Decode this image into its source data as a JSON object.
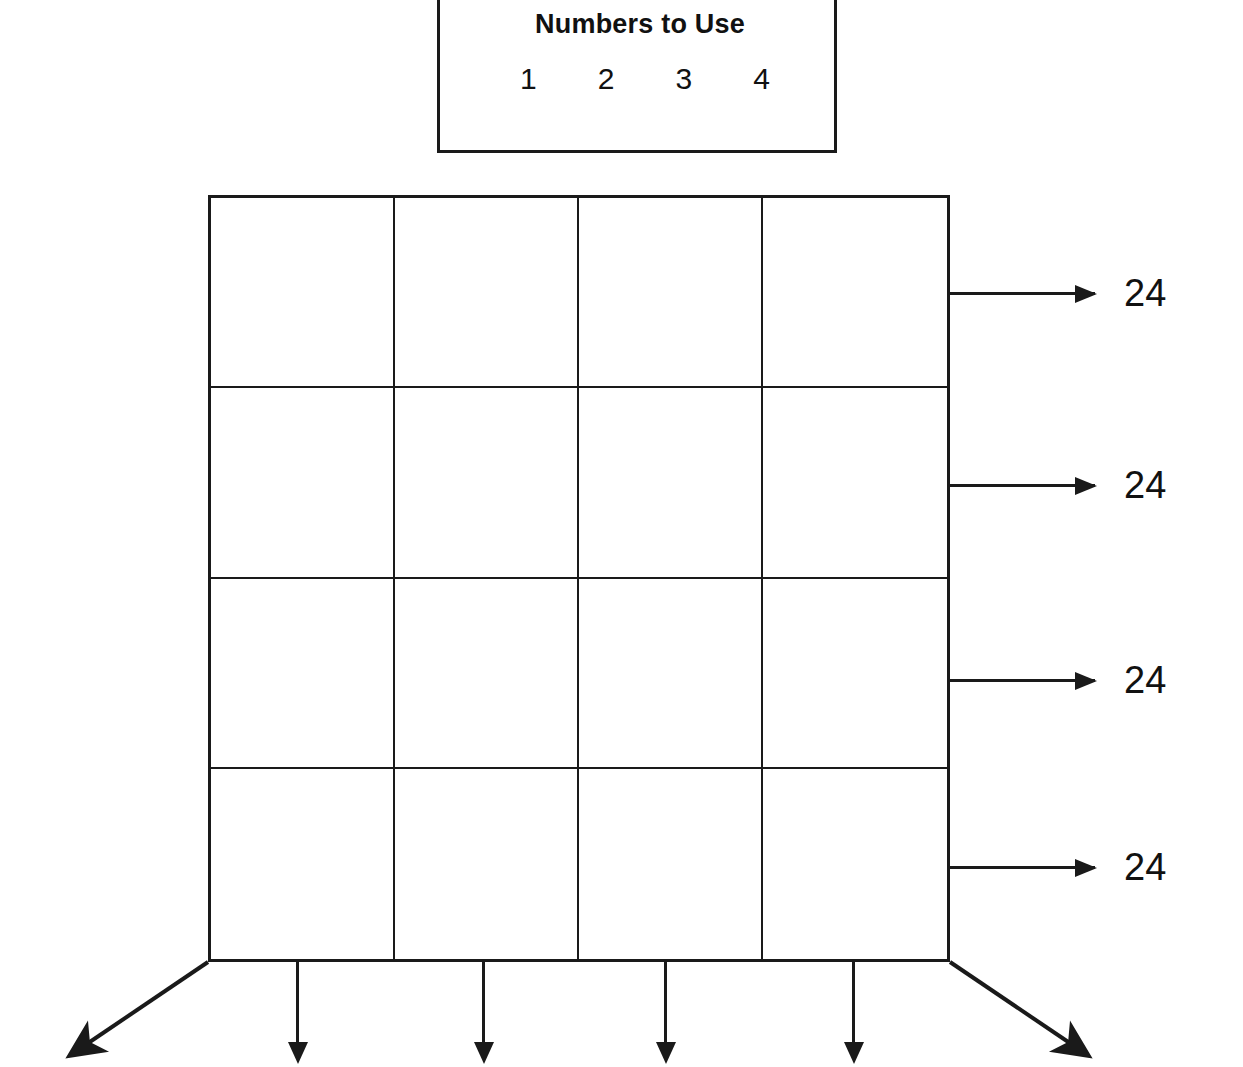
{
  "legend": {
    "title": "Numbers to Use",
    "numbers": [
      "1",
      "2",
      "3",
      "4"
    ]
  },
  "puzzle": {
    "grid": {
      "rows": 4,
      "columns": 4,
      "cells": [
        [
          "",
          "",
          "",
          ""
        ],
        [
          "",
          "",
          "",
          ""
        ],
        [
          "",
          "",
          "",
          ""
        ],
        [
          "",
          "",
          "",
          ""
        ]
      ]
    },
    "row_sums": [
      "24",
      "24",
      "24",
      "24"
    ],
    "column_sum_arrow_count": 5,
    "diagonal_arrow_count": 2
  },
  "colors": {
    "ink": "#1a1a1a",
    "paper": "#ffffff"
  }
}
